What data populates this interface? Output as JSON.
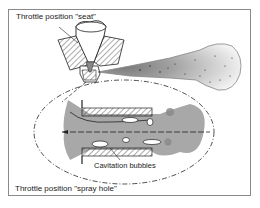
{
  "figure": {
    "labels": {
      "top": "Throttle position \"seat\"",
      "bottom": "Throttle position \"spray hole\"",
      "callout": "Cavitation bubbles"
    },
    "elements": [
      "nozzle-body-hatched",
      "needle",
      "spray-plume",
      "detail-ellipse",
      "spray-hole-cross-section",
      "cavitation-bubbles",
      "flow-centerline"
    ],
    "colors": {
      "line": "#222222",
      "frame": "#8a8a8a",
      "fluid": "#a8a8a8",
      "hatch": "#444444"
    }
  }
}
